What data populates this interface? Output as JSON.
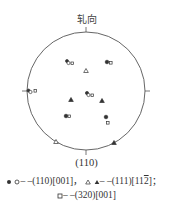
{
  "figure": {
    "top_label": "轧向",
    "bottom_label": "(110)"
  },
  "legend": [
    {
      "symbols": [
        "filled-circle",
        "open-circle"
      ],
      "text": "—(110)[001];"
    },
    {
      "symbols": [
        "open-triangle",
        "filled-triangle"
      ],
      "text": "—(111)[11̅2];"
    },
    {
      "symbols": [
        "open-square"
      ],
      "text": "—(320)[001]"
    }
  ],
  "legend_display": {
    "line1_a": "– –(110)[001]，",
    "line1_b": "– –(111)[11",
    "line1_c": "2",
    "line1_d": "]；",
    "line2": "– –(320)[001]"
  },
  "colors": {
    "ink": "#333333",
    "background": "#ffffff"
  },
  "markers": [
    {
      "x": 68,
      "y": 62,
      "types": [
        "filled-circle",
        "open-circle",
        "open-square"
      ]
    },
    {
      "x": 86,
      "y": 71,
      "types": [
        "open-triangle"
      ]
    },
    {
      "x": 108,
      "y": 62,
      "types": [
        "filled-circle",
        "open-square"
      ]
    },
    {
      "x": 30,
      "y": 91,
      "types": [
        "filled-circle",
        "open-circle",
        "open-square"
      ]
    },
    {
      "x": 88,
      "y": 94,
      "types": [
        "open-circle",
        "filled-circle",
        "open-square"
      ]
    },
    {
      "x": 71,
      "y": 100,
      "types": [
        "filled-triangle"
      ]
    },
    {
      "x": 102,
      "y": 101,
      "types": [
        "filled-triangle"
      ]
    },
    {
      "x": 66,
      "y": 116,
      "types": [
        "filled-circle",
        "open-square"
      ]
    },
    {
      "x": 106,
      "y": 118,
      "types": [
        "filled-circle",
        "open-square"
      ]
    },
    {
      "x": 56,
      "y": 142,
      "types": [
        "open-triangle"
      ]
    },
    {
      "x": 114,
      "y": 143,
      "types": [
        "filled-triangle"
      ]
    }
  ]
}
